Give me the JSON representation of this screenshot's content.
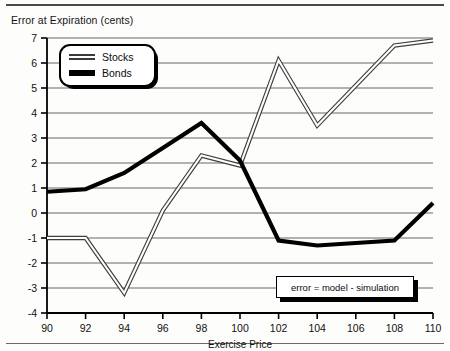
{
  "figure": {
    "title": "Error at Expiration (cents)",
    "annotation": "error = model - simulation"
  },
  "legend": {
    "position": "top-left-inside",
    "entries": [
      {
        "label": "Stocks",
        "style": "thin-gray-double"
      },
      {
        "label": "Bonds",
        "style": "thick-black"
      }
    ]
  },
  "axis": {
    "x_label": "Exercise Price",
    "x_ticks": [
      "90",
      "92",
      "94",
      "96",
      "98",
      "100",
      "102",
      "104",
      "106",
      "108",
      "110"
    ],
    "y_ticks": [
      "7",
      "6",
      "5",
      "4",
      "3",
      "2",
      "1",
      "0",
      "-1",
      "-2",
      "-3",
      "-4"
    ]
  },
  "chart_data": {
    "type": "line",
    "title": "Error at Expiration (cents)",
    "xlabel": "Exercise Price",
    "ylabel": "Error at Expiration (cents)",
    "xlim": [
      90,
      110
    ],
    "ylim": [
      -4,
      7
    ],
    "xticks": [
      90,
      92,
      94,
      96,
      98,
      100,
      102,
      104,
      106,
      108,
      110
    ],
    "yticks": [
      -4,
      -3,
      -2,
      -1,
      0,
      1,
      2,
      3,
      4,
      5,
      6,
      7
    ],
    "grid": "horizontal",
    "legend_position": "upper left",
    "annotations": [
      "error = model - simulation"
    ],
    "x": [
      90,
      92,
      94,
      96,
      98,
      100,
      102,
      104,
      106,
      108,
      110
    ],
    "series": [
      {
        "name": "Stocks",
        "color": "#555555",
        "values": [
          -1.0,
          -1.0,
          -3.2,
          0.1,
          2.3,
          1.9,
          6.1,
          3.5,
          5.1,
          6.7,
          6.9
        ]
      },
      {
        "name": "Bonds",
        "color": "#000000",
        "values": [
          0.85,
          0.95,
          1.6,
          2.6,
          3.6,
          2.1,
          -1.1,
          -1.3,
          -1.2,
          -1.1,
          0.4
        ]
      }
    ]
  },
  "colors": {
    "stocks": "#555555",
    "bonds": "#000000",
    "grid": "#555555",
    "axis": "#000000"
  }
}
